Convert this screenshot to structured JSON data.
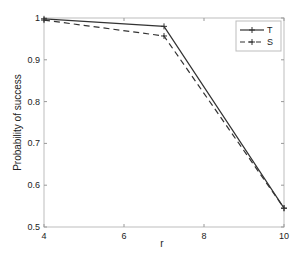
{
  "chart_data": {
    "type": "line",
    "title": "",
    "xlabel": "r",
    "ylabel": "Probability of success",
    "xlim": [
      4,
      10
    ],
    "ylim": [
      0.5,
      1
    ],
    "xticks": [
      4,
      6,
      8,
      10
    ],
    "yticks": [
      0.5,
      0.6,
      0.7,
      0.8,
      0.9,
      1
    ],
    "xtick_labels": [
      "4",
      "6",
      "8",
      "10"
    ],
    "ytick_labels": [
      "0.5",
      "0.6",
      "0.7",
      "0.8",
      "0.9",
      "1"
    ],
    "grid": false,
    "legend_position": "upper right",
    "x": [
      4,
      7,
      10
    ],
    "series": [
      {
        "name": "T",
        "style": "solid",
        "marker": "+",
        "color": "#333333",
        "values": [
          0.998,
          0.98,
          0.545
        ]
      },
      {
        "name": "S",
        "style": "dashed",
        "marker": "+",
        "color": "#333333",
        "values": [
          0.995,
          0.957,
          0.545
        ]
      }
    ]
  }
}
